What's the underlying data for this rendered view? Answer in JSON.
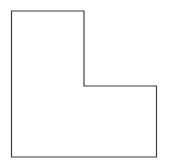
{
  "figure": {
    "background_color": "#ffffff"
  },
  "chart_data": {
    "type": "diagram",
    "shape_name": "L-shape",
    "title": "",
    "xlabel": "",
    "ylabel": "",
    "grid": false,
    "legend": "none",
    "canvas": {
      "width": 169,
      "height": 168
    },
    "stroke_color": "#3a3a3a",
    "fill_color": "#ffffff",
    "stroke_width": 1.15,
    "vertex_count": 6,
    "vertices": [
      {
        "name": "top-left",
        "x": 11.5,
        "y": 11.0
      },
      {
        "name": "top-right",
        "x": 84.0,
        "y": 11.0
      },
      {
        "name": "notch-upper",
        "x": 84.0,
        "y": 86.0
      },
      {
        "name": "notch-right",
        "x": 156.5,
        "y": 86.0
      },
      {
        "name": "bottom-right",
        "x": 156.5,
        "y": 157.0
      },
      {
        "name": "bottom-left",
        "x": 11.5,
        "y": 157.0
      }
    ],
    "edges": [
      {
        "name": "top-edge",
        "orientation": "horizontal",
        "length": 72.5
      },
      {
        "name": "upper-right-edge",
        "orientation": "vertical",
        "length": 75.0
      },
      {
        "name": "notch-edge",
        "orientation": "horizontal",
        "length": 72.5
      },
      {
        "name": "right-edge",
        "orientation": "vertical",
        "length": 71.0
      },
      {
        "name": "bottom-edge",
        "orientation": "horizontal",
        "length": 145.0
      },
      {
        "name": "left-edge",
        "orientation": "vertical",
        "length": 146.0
      }
    ],
    "path_d": "M 11.5 11 L 84 11 L 84 86 L 156.5 86 L 156.5 157 L 11.5 157 Z"
  }
}
